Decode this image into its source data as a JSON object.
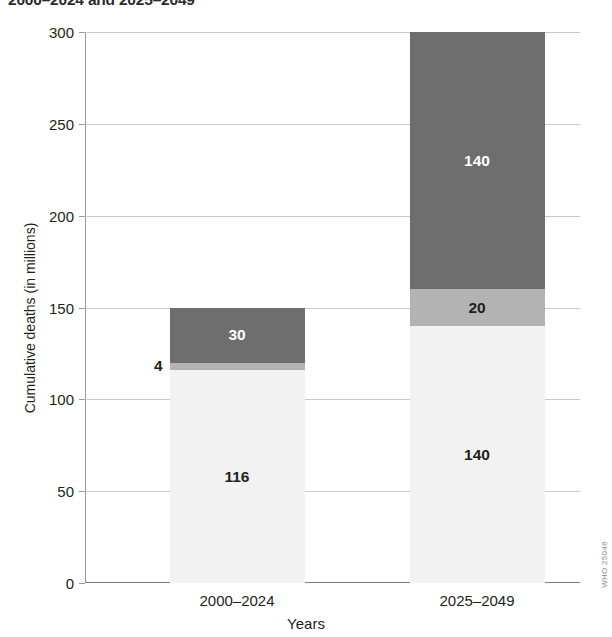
{
  "chart_data": {
    "type": "bar",
    "stacked": true,
    "title": "2000–2024 and 2025–2049",
    "xlabel": "Years",
    "ylabel": "Cumulative deaths (in millions)",
    "categories": [
      "2000–2024",
      "2025–2049"
    ],
    "ylim": [
      0,
      300
    ],
    "yticks": [
      0,
      50,
      100,
      150,
      200,
      250,
      300
    ],
    "ytick_labels": [
      "0",
      "50",
      "100",
      "150",
      "200",
      "250",
      "300"
    ],
    "grid": true,
    "legend": "none",
    "series": [
      {
        "name": "lower-segment",
        "color": "#f2f2f2",
        "values": [
          116,
          140
        ],
        "labels": [
          "116",
          "140"
        ],
        "label_color": "#231f20",
        "label_position": "inside"
      },
      {
        "name": "middle-segment",
        "color": "#b3b3b3",
        "values": [
          4,
          20
        ],
        "labels": [
          "4",
          "20"
        ],
        "label_color": "#231f20",
        "label_position_by_bar": [
          "outside-left",
          "inside"
        ]
      },
      {
        "name": "upper-segment",
        "color": "#6e6e6e",
        "values": [
          30,
          140
        ],
        "labels": [
          "30",
          "140"
        ],
        "label_color": "#ffffff",
        "label_position": "inside"
      }
    ],
    "totals": [
      150,
      300
    ]
  },
  "watermark": {
    "text": "WHO 25046"
  }
}
